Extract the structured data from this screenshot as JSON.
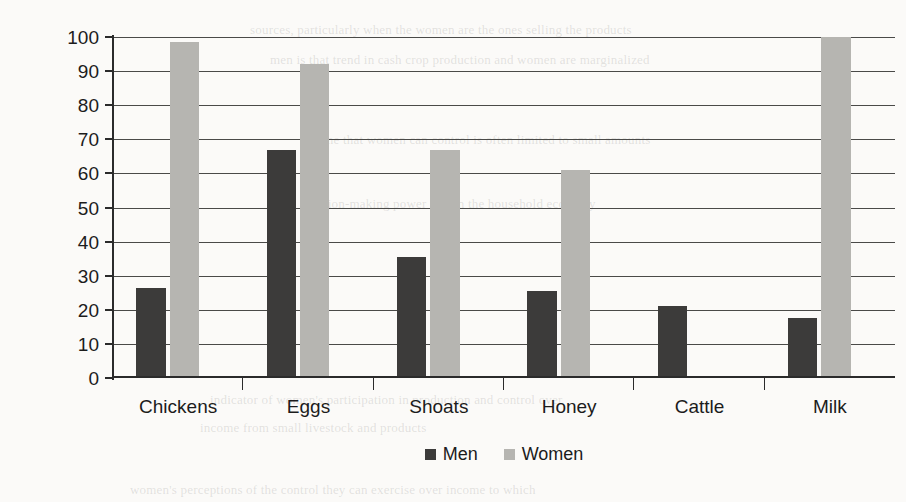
{
  "chart_data": {
    "type": "bar",
    "title": "",
    "xlabel": "",
    "ylabel": "% income share to women",
    "ylim": [
      0,
      100
    ],
    "ytick_step": 10,
    "yticks": [
      "100",
      "90",
      "80",
      "70",
      "60",
      "50",
      "40",
      "30",
      "20",
      "10",
      "0"
    ],
    "grid": true,
    "legend_position": "bottom-center",
    "categories": [
      "Chickens",
      "Eggs",
      "Shoats",
      "Honey",
      "Cattle",
      "Milk"
    ],
    "series": [
      {
        "name": "Men",
        "color": "#3c3b3a",
        "values": [
          26.5,
          67,
          35.5,
          25.5,
          21,
          17.5
        ]
      },
      {
        "name": "Women",
        "color": "#b6b5b1",
        "values": [
          98.5,
          92,
          67,
          61,
          0,
          100
        ]
      }
    ]
  },
  "axis": {
    "y_title": "% income share to women"
  },
  "legend": {
    "items": [
      {
        "label": "Men",
        "color": "#3c3b3a"
      },
      {
        "label": "Women",
        "color": "#b6b5b1"
      }
    ]
  },
  "background_text": {
    "line1": "sources, particularly when the women are the ones selling the products",
    "line2": "men is that trend in cash crop production and women are marginalized",
    "line3": "income that women can control is often limited to small amounts",
    "line4": "decision-making power within the household economy",
    "line5": "indicator of women's participation in production and control over",
    "line6": "income from small livestock and products",
    "line7": "women's perceptions of the control they can exercise over income to which"
  }
}
